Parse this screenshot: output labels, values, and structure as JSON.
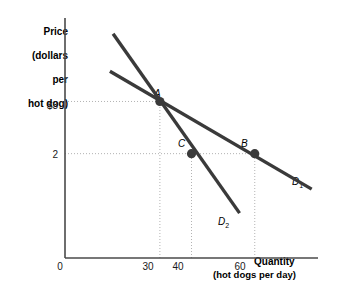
{
  "chart_data": {
    "type": "line",
    "title": "",
    "xlabel": "Quantity",
    "xlabel_sub": "(hot dogs per day)",
    "ylabel_lines": [
      "Price",
      "(dollars",
      "per",
      "hot dog)"
    ],
    "xlim": [
      0,
      80
    ],
    "ylim": [
      0,
      4.6
    ],
    "grid": false,
    "xticks": [
      {
        "value": 0,
        "label": "0"
      },
      {
        "value": 30,
        "label": "30"
      },
      {
        "value": 40,
        "label": "40"
      },
      {
        "value": 60,
        "label": "60"
      }
    ],
    "yticks": [
      {
        "value": 3,
        "label": "$3"
      },
      {
        "value": 2,
        "label": "2"
      }
    ],
    "series": [
      {
        "name": "D1",
        "label": "D",
        "label_sub": "1",
        "description": "flatter demand curve",
        "points": [
          [
            14.2,
            3.58
          ],
          [
            78.0,
            1.32
          ]
        ]
      },
      {
        "name": "D2",
        "label": "D",
        "label_sub": "2",
        "description": "steeper demand curve",
        "points": [
          [
            15.2,
            4.3
          ],
          [
            55.2,
            0.86
          ]
        ]
      }
    ],
    "annotations": [
      {
        "name": "A",
        "label": "A",
        "x": 30,
        "y": 3,
        "on": "both",
        "note": "intersection of D1 and D2"
      },
      {
        "name": "C",
        "label": "C",
        "x": 40,
        "y": 2,
        "on": "D2"
      },
      {
        "name": "B",
        "label": "B",
        "x": 60,
        "y": 2,
        "on": "D1"
      }
    ],
    "guide_lines": [
      {
        "type": "horizontal",
        "y": 3,
        "from_x": 0,
        "to_x": 30
      },
      {
        "type": "horizontal",
        "y": 2,
        "from_x": 0,
        "to_x": 60
      },
      {
        "type": "vertical",
        "x": 30,
        "from_y": 0,
        "to_y": 3
      },
      {
        "type": "vertical",
        "x": 40,
        "from_y": 0,
        "to_y": 2
      },
      {
        "type": "vertical",
        "x": 60,
        "from_y": 0,
        "to_y": 2
      }
    ]
  },
  "colors": {
    "curve": "#3a3a3a",
    "axis": "#4a4a4a",
    "guide": "#b3b3b3",
    "text": "#000000",
    "background": "#ffffff"
  }
}
